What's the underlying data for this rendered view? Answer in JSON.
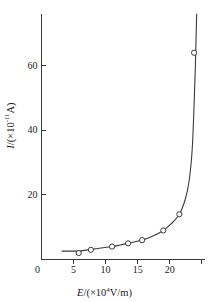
{
  "chart_data": {
    "type": "line",
    "title": "",
    "subtitle": "",
    "xlabel_parts": {
      "variable": "E",
      "slash": "/(",
      "times": "×",
      "base": "10",
      "exponent": "4",
      "unit": "V/m)"
    },
    "ylabel_parts": {
      "variable": "I",
      "slash": "/(",
      "times": "×",
      "base": "10",
      "exponent": "-11",
      "unit": "A)"
    },
    "xlabel": "E/(×10⁴V/m)",
    "ylabel": "I/(×10⁻¹¹A)",
    "xlim": [
      0,
      25.5
    ],
    "ylim": [
      0,
      76
    ],
    "xticks": [
      0,
      5,
      10,
      15,
      20
    ],
    "yticks": [
      0,
      20,
      40,
      60
    ],
    "xtick_labels": [
      "0",
      "5",
      "10",
      "15",
      "20"
    ],
    "ytick_labels": [
      "0",
      "20",
      "40",
      "60"
    ],
    "grid": false,
    "legend": false,
    "marker": "open-circle",
    "x": [
      5.8,
      7.7,
      11.0,
      13.5,
      15.7,
      19.0,
      21.5,
      23.8
    ],
    "y": [
      2.0,
      3.0,
      4.0,
      5.0,
      6.0,
      9.0,
      14.0,
      64.0
    ],
    "series": [
      {
        "name": "I vs E",
        "x": [
          5.8,
          7.7,
          11.0,
          13.5,
          15.7,
          19.0,
          21.5,
          23.8
        ],
        "values": [
          2.0,
          3.0,
          4.0,
          5.0,
          6.0,
          9.0,
          14.0,
          64.0
        ]
      }
    ],
    "curve_x": [
      3.2,
      4.5,
      5.8,
      7.0,
      7.7,
      9.0,
      11.0,
      12.3,
      13.5,
      14.6,
      15.7,
      17.3,
      19.0,
      20.2,
      21.5,
      22.4,
      23.0,
      23.5,
      23.8,
      24.0,
      24.1,
      24.2
    ],
    "curve_y": [
      2.6,
      2.6,
      2.6,
      2.9,
      3.1,
      3.5,
      4.0,
      4.5,
      5.0,
      5.5,
      6.0,
      7.2,
      9.0,
      11.0,
      14.0,
      18.5,
      24.0,
      34.0,
      48.0,
      60.0,
      68.0,
      76.0
    ],
    "axis_color": "#3a3a3a",
    "curve_color": "#3a3a3a",
    "marker_color": "#3a3a3a",
    "background_color": "#ffffff"
  }
}
